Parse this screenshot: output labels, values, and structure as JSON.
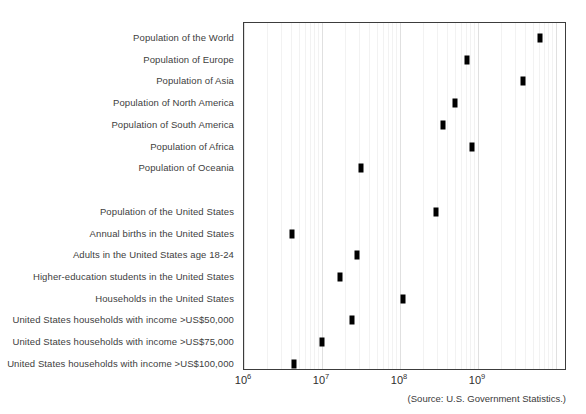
{
  "chart_data": {
    "type": "scatter",
    "title": "",
    "subtitle": "",
    "xlabel": "",
    "ylabel": "",
    "xscale": "log",
    "xlim": [
      1000000,
      5000000000
    ],
    "grid": true,
    "grid_axis": "x",
    "legend": "none",
    "orientation": "horizontal",
    "marker_style": "filled black rectangle",
    "x_ticks": [
      {
        "value": 1000000,
        "label": "10",
        "exponent": "6"
      },
      {
        "value": 10000000,
        "label": "10",
        "exponent": "7"
      },
      {
        "value": 100000000,
        "label": "10",
        "exponent": "8"
      },
      {
        "value": 1000000000,
        "label": "10",
        "exponent": "9"
      }
    ],
    "categories": [
      "Population of the World",
      "Population of Europe",
      "Population of Asia",
      "Population of North America",
      "Population of South America",
      "Population of Africa",
      "Population of Oceania",
      "",
      "Population of the United States",
      "Annual births in the United States",
      "Adults in the United States age 18-24",
      "Higher-education students in the United States",
      "Households in the United States",
      "United States households with income >US$50,000",
      "United States households with income >US$75,000",
      "United States households with income >US$100,000"
    ],
    "points": [
      {
        "label": "Population of the World",
        "value": 6300000000
      },
      {
        "label": "Population of Europe",
        "value": 730000000
      },
      {
        "label": "Population of Asia",
        "value": 3800000000
      },
      {
        "label": "Population of North America",
        "value": 510000000
      },
      {
        "label": "Population of South America",
        "value": 360000000
      },
      {
        "label": "Population of Africa",
        "value": 850000000
      },
      {
        "label": "Population of Oceania",
        "value": 32000000
      },
      {
        "label": "Population of the United States",
        "value": 290000000
      },
      {
        "label": "Annual births in the United States",
        "value": 4100000
      },
      {
        "label": "Adults in the United States age 18-24",
        "value": 28000000
      },
      {
        "label": "Higher-education students in the United States",
        "value": 17000000
      },
      {
        "label": "Households in the United States",
        "value": 110000000
      },
      {
        "label": "United States households with income >US$50,000",
        "value": 24000000
      },
      {
        "label": "United States households with income >US$75,000",
        "value": 10000000
      },
      {
        "label": "United States households with income >US$100,000",
        "value": 4400000
      }
    ]
  },
  "source": {
    "note": "(Source: U.S. Government Statistics.)"
  }
}
